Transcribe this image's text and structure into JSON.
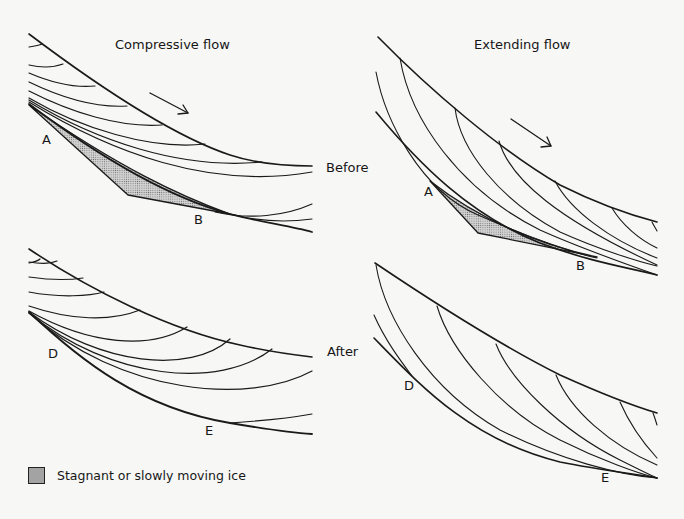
{
  "titles": {
    "compressive": "Compressive flow",
    "extending": "Extending flow"
  },
  "stages": {
    "before": "Before",
    "after": "After"
  },
  "points": {
    "compressive_before_a": "A",
    "compressive_before_b": "B",
    "extending_before_a": "A",
    "extending_before_b": "B",
    "compressive_after_d": "D",
    "compressive_after_e": "E",
    "extending_after_d": "D",
    "extending_after_e": "E"
  },
  "legend": {
    "label": "Stagnant or slowly moving ice",
    "fill": "#c9c9c9"
  },
  "colors": {
    "line": "#1a1a1a",
    "background": "#f7f7f5"
  },
  "annotations": {
    "flow_direction": "arrow pointing downslope (right/down)"
  }
}
